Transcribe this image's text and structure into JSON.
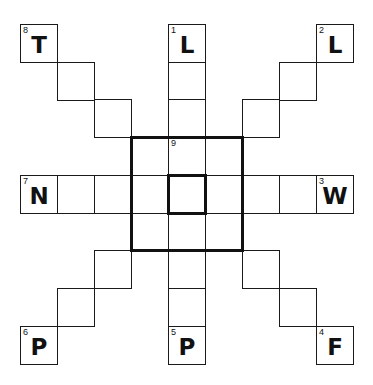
{
  "puzzle": {
    "grid": {
      "origin_x": 20,
      "origin_y": 24,
      "cell_w": 37,
      "cell_h": 37.7,
      "rows": 9,
      "cols": 9
    },
    "cells": [
      {
        "r": 0,
        "c": 0,
        "num": "8",
        "letter": "T"
      },
      {
        "r": 1,
        "c": 1,
        "num": "",
        "letter": ""
      },
      {
        "r": 2,
        "c": 2,
        "num": "",
        "letter": ""
      },
      {
        "r": 0,
        "c": 8,
        "num": "2",
        "letter": "L"
      },
      {
        "r": 1,
        "c": 7,
        "num": "",
        "letter": ""
      },
      {
        "r": 2,
        "c": 6,
        "num": "",
        "letter": ""
      },
      {
        "r": 6,
        "c": 2,
        "num": "",
        "letter": ""
      },
      {
        "r": 7,
        "c": 1,
        "num": "",
        "letter": ""
      },
      {
        "r": 8,
        "c": 0,
        "num": "6",
        "letter": "P"
      },
      {
        "r": 6,
        "c": 6,
        "num": "",
        "letter": ""
      },
      {
        "r": 7,
        "c": 7,
        "num": "",
        "letter": ""
      },
      {
        "r": 8,
        "c": 8,
        "num": "4",
        "letter": "F"
      },
      {
        "r": 0,
        "c": 4,
        "num": "1",
        "letter": "L"
      },
      {
        "r": 1,
        "c": 4,
        "num": "",
        "letter": ""
      },
      {
        "r": 2,
        "c": 4,
        "num": "",
        "letter": ""
      },
      {
        "r": 3,
        "c": 4,
        "num": "9",
        "letter": ""
      },
      {
        "r": 5,
        "c": 4,
        "num": "",
        "letter": ""
      },
      {
        "r": 6,
        "c": 4,
        "num": "",
        "letter": ""
      },
      {
        "r": 7,
        "c": 4,
        "num": "",
        "letter": ""
      },
      {
        "r": 8,
        "c": 4,
        "num": "5",
        "letter": "P"
      },
      {
        "r": 4,
        "c": 0,
        "num": "7",
        "letter": "N"
      },
      {
        "r": 4,
        "c": 1,
        "num": "",
        "letter": ""
      },
      {
        "r": 4,
        "c": 2,
        "num": "",
        "letter": ""
      },
      {
        "r": 4,
        "c": 3,
        "num": "",
        "letter": ""
      },
      {
        "r": 4,
        "c": 4,
        "num": "",
        "letter": ""
      },
      {
        "r": 4,
        "c": 5,
        "num": "",
        "letter": ""
      },
      {
        "r": 4,
        "c": 6,
        "num": "",
        "letter": ""
      },
      {
        "r": 4,
        "c": 7,
        "num": "",
        "letter": ""
      },
      {
        "r": 4,
        "c": 8,
        "num": "3",
        "letter": "W"
      },
      {
        "r": 3,
        "c": 3,
        "num": "",
        "letter": ""
      },
      {
        "r": 3,
        "c": 5,
        "num": "",
        "letter": ""
      },
      {
        "r": 5,
        "c": 3,
        "num": "",
        "letter": ""
      },
      {
        "r": 5,
        "c": 5,
        "num": "",
        "letter": ""
      }
    ],
    "thick_boxes": [
      {
        "name": "center-block-border",
        "r": 3,
        "c": 3,
        "h": 3,
        "w": 3
      },
      {
        "name": "center-cell-border",
        "r": 4,
        "c": 4,
        "h": 1,
        "w": 1
      }
    ],
    "clues": [
      {
        "number": "1",
        "start_letter": "L",
        "direction": "down"
      },
      {
        "number": "2",
        "start_letter": "L",
        "direction": "diagonal-down-left"
      },
      {
        "number": "3",
        "start_letter": "W",
        "direction": "left"
      },
      {
        "number": "4",
        "start_letter": "F",
        "direction": "diagonal-up-left"
      },
      {
        "number": "5",
        "start_letter": "P",
        "direction": "up"
      },
      {
        "number": "6",
        "start_letter": "P",
        "direction": "diagonal-up-right"
      },
      {
        "number": "7",
        "start_letter": "N",
        "direction": "right"
      },
      {
        "number": "8",
        "start_letter": "T",
        "direction": "diagonal-down-right"
      },
      {
        "number": "9",
        "start_letter": "",
        "direction": "around-center"
      }
    ]
  }
}
